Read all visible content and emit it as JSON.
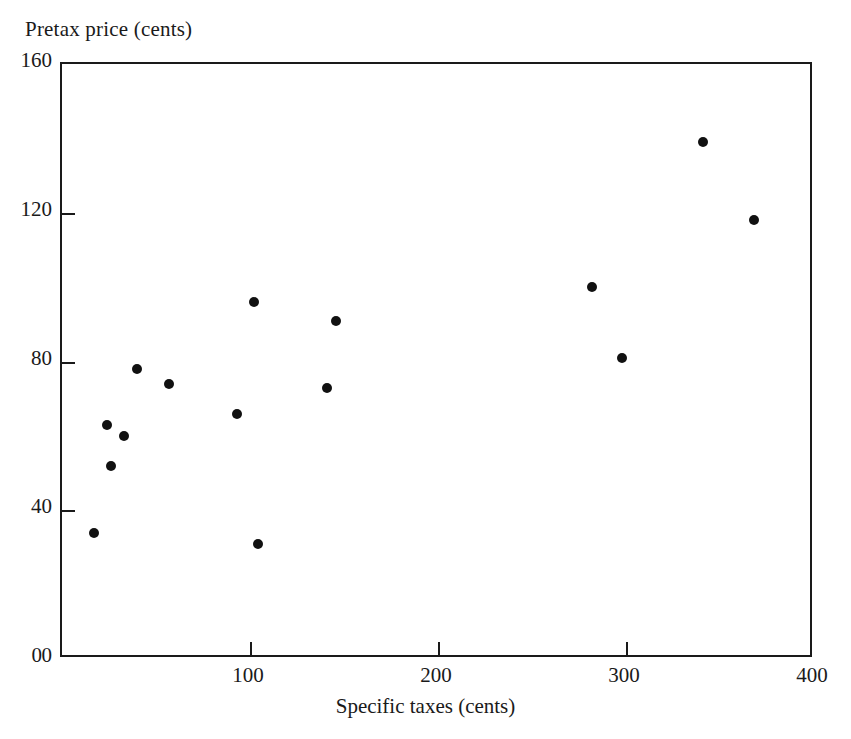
{
  "chart_data": {
    "type": "scatter",
    "title": "",
    "xlabel": "Specific taxes (cents)",
    "ylabel": "Pretax price (cents)",
    "xlim": [
      0,
      400
    ],
    "ylim": [
      0,
      160
    ],
    "xticks": [
      0,
      100,
      200,
      300,
      400
    ],
    "yticks": [
      0,
      40,
      80,
      120,
      160
    ],
    "xticklabels": [
      "0",
      "100",
      "200",
      "300",
      "400"
    ],
    "yticklabels": [
      "0",
      "40",
      "80",
      "120",
      "160"
    ],
    "grid": false,
    "legend": null,
    "marker": "filled-circle",
    "marker_color": "#111111",
    "points": [
      {
        "x": 17,
        "y": 34
      },
      {
        "x": 24,
        "y": 63
      },
      {
        "x": 26,
        "y": 52
      },
      {
        "x": 33,
        "y": 60
      },
      {
        "x": 40,
        "y": 78
      },
      {
        "x": 57,
        "y": 74
      },
      {
        "x": 93,
        "y": 66
      },
      {
        "x": 102,
        "y": 96
      },
      {
        "x": 104,
        "y": 31
      },
      {
        "x": 141,
        "y": 73
      },
      {
        "x": 146,
        "y": 91
      },
      {
        "x": 282,
        "y": 100
      },
      {
        "x": 298,
        "y": 81
      },
      {
        "x": 341,
        "y": 139
      },
      {
        "x": 368,
        "y": 118
      }
    ]
  },
  "colors": {
    "axis": "#1a1a1a",
    "marker": "#111111",
    "background": "#ffffff"
  }
}
